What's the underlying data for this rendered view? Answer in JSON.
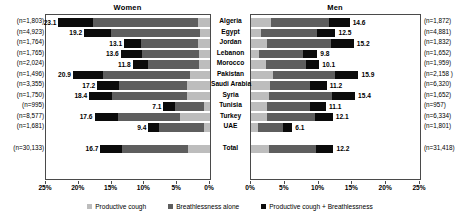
{
  "chart_data": {
    "type": "bar",
    "title": "",
    "subtype": "stacked-horizontal-bidirectional",
    "panels": [
      {
        "key": "women",
        "title": "Women",
        "axis_direction": "right-to-left"
      },
      {
        "key": "men",
        "title": "Men",
        "axis_direction": "left-to-right"
      }
    ],
    "categories": [
      "Algeria",
      "Egypt",
      "Jordan",
      "Lebanon",
      "Morocco",
      "Pakistan",
      "Saudi Arabia",
      "Syria",
      "Tunisia",
      "Turkey",
      "UAE",
      "Total"
    ],
    "xlabel": "",
    "ylabel": "",
    "xlim": [
      0,
      25
    ],
    "xticks": [
      0,
      5,
      10,
      15,
      20,
      25
    ],
    "xticklabels_women": [
      "25%",
      "20%",
      "15%",
      "10%",
      "5%",
      "0%"
    ],
    "xticklabels_men": [
      "0%",
      "5%",
      "10%",
      "15%",
      "20%",
      "25%"
    ],
    "grid": false,
    "legend_position": "bottom",
    "legend": [
      {
        "label": "Productive cough",
        "color": "#bdbdbd"
      },
      {
        "label": "Breathlessness alone",
        "color": "#5e5e5e"
      },
      {
        "label": "Productive cough + Breathlessness",
        "color": "#0b0b0b"
      }
    ],
    "series": [
      {
        "name": "Productive cough + Breathlessness",
        "color": "#0b0b0b",
        "women": [
          5.2,
          4.1,
          2.6,
          3.3,
          2.4,
          4.6,
          3.3,
          3.4,
          1.7,
          3.6,
          1.6,
          3.3
        ],
        "men": [
          3.0,
          2.8,
          3.4,
          2.1,
          1.9,
          3.4,
          2.4,
          3.4,
          2.3,
          2.6,
          1.3,
          2.6
        ]
      },
      {
        "name": "Breathlessness alone",
        "color": "#5e5e5e",
        "women": [
          16.0,
          13.5,
          8.6,
          8.6,
          7.7,
          13.2,
          10.4,
          11.5,
          4.5,
          9.5,
          6.9,
          10.1
        ],
        "men": [
          8.7,
          8.2,
          9.5,
          6.5,
          6.0,
          9.2,
          6.0,
          9.3,
          6.5,
          7.1,
          3.8,
          7.0
        ]
      },
      {
        "name": "Productive cough",
        "color": "#bdbdbd",
        "women": [
          1.9,
          1.6,
          1.9,
          1.7,
          1.7,
          3.1,
          3.5,
          3.5,
          0.9,
          4.5,
          0.9,
          3.3
        ],
        "men": [
          2.9,
          1.5,
          2.3,
          1.2,
          2.2,
          3.3,
          2.8,
          2.7,
          2.3,
          2.4,
          1.0,
          2.6
        ]
      }
    ],
    "totals": {
      "women": [
        "23.1",
        "19.2",
        "13.1",
        "13.6",
        "11.8",
        "20.9",
        "17.2",
        "18.4",
        "7.1",
        "17.6",
        "9.4",
        "16.7"
      ],
      "men": [
        "14.6",
        "12.5",
        "15.2",
        "9.8",
        "10.1",
        "15.9",
        "11.2",
        "15.4",
        "11.1",
        "12.1",
        "6.1",
        "12.2"
      ]
    },
    "n_labels": {
      "women": [
        "(n=1,803)",
        "(n=4,923)",
        "(n=1,764)",
        "(n=1,765)",
        "(n=2,024)",
        "(n=1,496)",
        "(n=3,355)",
        "(n=1,750)",
        "(n=995)",
        "(n=8,577)",
        "(n=1,681)",
        "(n=30,133)"
      ],
      "men": [
        "(n=1,872)",
        "(n=4,881)",
        "(n=1,832)",
        "(n=1,652)",
        "(n=1,959)",
        "(n=2,158 )",
        "(n=6,320)",
        "(n=1,652)",
        "(n=957)",
        "(n=6,334)",
        "(n=1,801)",
        "(n=31,418)"
      ]
    }
  }
}
